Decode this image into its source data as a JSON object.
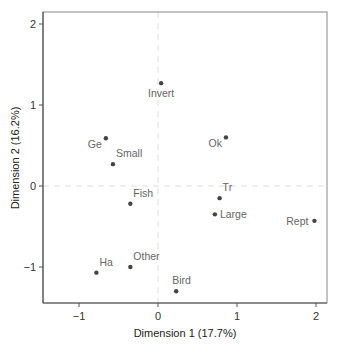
{
  "chart_data": {
    "type": "scatter",
    "title": "",
    "xlabel": "Dimension 1 (17.7%)",
    "ylabel": "Dimension 2 (16.2%)",
    "xlim": [
      -1.45,
      2.15
    ],
    "ylim": [
      -1.45,
      2.15
    ],
    "xticks": [
      -1,
      0,
      1,
      2
    ],
    "yticks": [
      -1,
      0,
      1,
      2
    ],
    "xtick_labels": [
      "−1",
      "0",
      "1",
      "2"
    ],
    "ytick_labels": [
      "−1",
      "0",
      "1",
      "2"
    ],
    "grid": false,
    "reference_lines": {
      "x": 0,
      "y": 0,
      "style": "dashed"
    },
    "legend": null,
    "points": [
      {
        "label": "Invert",
        "x": 0.04,
        "y": 1.27,
        "label_pos": "below"
      },
      {
        "label": "Ge",
        "x": -0.66,
        "y": 0.59,
        "label_pos": "below-left"
      },
      {
        "label": "Small",
        "x": -0.57,
        "y": 0.27,
        "label_pos": "above-right"
      },
      {
        "label": "Ok",
        "x": 0.86,
        "y": 0.6,
        "label_pos": "below-left"
      },
      {
        "label": "Fish",
        "x": -0.35,
        "y": -0.22,
        "label_pos": "above-right"
      },
      {
        "label": "Tr",
        "x": 0.78,
        "y": -0.15,
        "label_pos": "above-right"
      },
      {
        "label": "Large",
        "x": 0.72,
        "y": -0.35,
        "label_pos": "right"
      },
      {
        "label": "Rept",
        "x": 1.98,
        "y": -0.43,
        "label_pos": "left"
      },
      {
        "label": "Ha",
        "x": -0.78,
        "y": -1.07,
        "label_pos": "above-right"
      },
      {
        "label": "Other",
        "x": -0.35,
        "y": -1.0,
        "label_pos": "above-right"
      },
      {
        "label": "Bird",
        "x": 0.23,
        "y": -1.3,
        "label_pos": "above"
      }
    ],
    "colors": {
      "point": "#444444",
      "label": "#666666",
      "axis": "#555555",
      "refline": "#dddddd"
    }
  }
}
